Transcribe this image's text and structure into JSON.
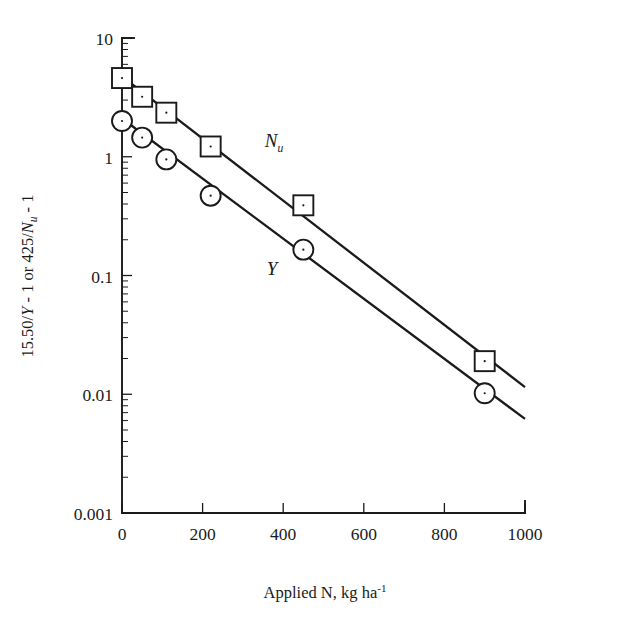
{
  "chart_data": {
    "type": "scatter",
    "title": "",
    "xlabel": "Applied N, kg ha-1",
    "xlabel_base": "Applied N, kg ha",
    "xlabel_exponent": "-1",
    "ylabel": "15.50/Y - 1 or 425/Nu - 1",
    "ylabel_part1": "15.50/",
    "ylabel_part2": "Y",
    "ylabel_part3": " - 1 or 425/",
    "ylabel_part4": "N",
    "ylabel_part5": "u",
    "ylabel_part6": " - 1",
    "xlim": [
      0,
      1000
    ],
    "ylim": [
      0.001,
      10
    ],
    "yscale": "log",
    "xscale": "linear",
    "grid": false,
    "legend": "inline-labels",
    "xticks": [
      0,
      200,
      400,
      600,
      800,
      1000
    ],
    "xtick_labels": [
      "0",
      "200",
      "400",
      "600",
      "800",
      "1000"
    ],
    "yticks": [
      10,
      1,
      0.1,
      0.01,
      0.001
    ],
    "ytick_labels": [
      "10",
      "1",
      "0.1",
      "0.01",
      "0.001"
    ],
    "series": [
      {
        "name": "Nu",
        "label": "N",
        "label_sub": "u",
        "marker": "square",
        "x": [
          0,
          50,
          110,
          220,
          450,
          900
        ],
        "values": [
          4.6,
          3.2,
          2.35,
          1.22,
          0.39,
          0.019
        ],
        "fit_x": [
          0,
          1000
        ],
        "fit_values": [
          4.75,
          0.0115
        ]
      },
      {
        "name": "Y",
        "label": "Y",
        "label_sub": "",
        "marker": "circle",
        "x": [
          0,
          50,
          110,
          220,
          450,
          900
        ],
        "values": [
          2.0,
          1.45,
          0.95,
          0.47,
          0.165,
          0.0102
        ],
        "fit_x": [
          0,
          1000
        ],
        "fit_values": [
          2.1,
          0.0062
        ]
      }
    ],
    "annotations": [
      {
        "text": "Nu",
        "x": 400,
        "y": 1.9
      },
      {
        "text": "Y",
        "x": 390,
        "y": 0.3
      }
    ]
  }
}
